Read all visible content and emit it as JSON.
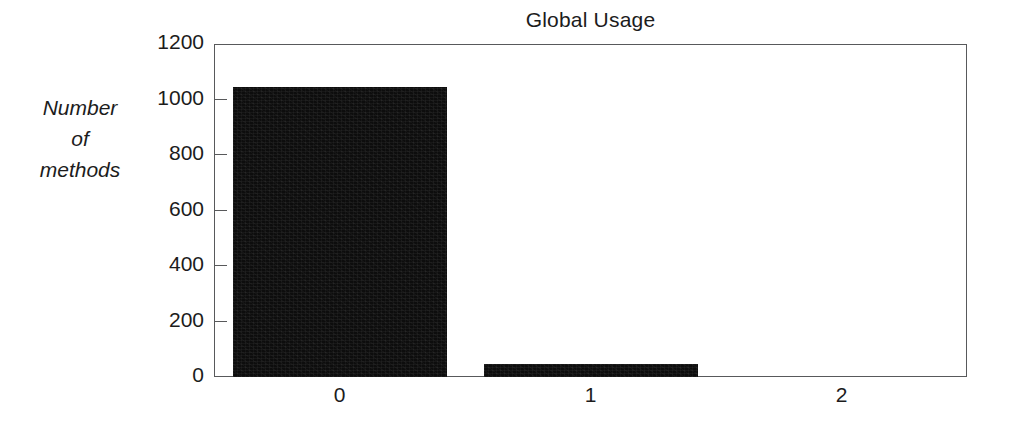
{
  "chart_data": {
    "type": "bar",
    "title": "Global Usage",
    "xlabel": "",
    "ylabel": "Number of methods",
    "ylabel_lines": [
      "Number",
      "of",
      "methods"
    ],
    "categories": [
      "0",
      "1",
      "2"
    ],
    "values": [
      1045,
      47,
      0
    ],
    "series": [
      {
        "name": "Number of methods",
        "values": [
          1045,
          47,
          0
        ]
      }
    ],
    "ylim": [
      0,
      1200
    ],
    "yticks": [
      0,
      200,
      400,
      600,
      800,
      1000,
      1200
    ],
    "ytick_labels": [
      "0",
      "200",
      "400",
      "600",
      "800",
      "1000",
      "1200"
    ],
    "xtick_labels": [
      "0",
      "1",
      "2"
    ],
    "grid": false,
    "legend": null,
    "bar_color": "#0d0d0d",
    "axis_color": "#58595b",
    "text_color": "#1c1c1c",
    "background": "#ffffff"
  }
}
